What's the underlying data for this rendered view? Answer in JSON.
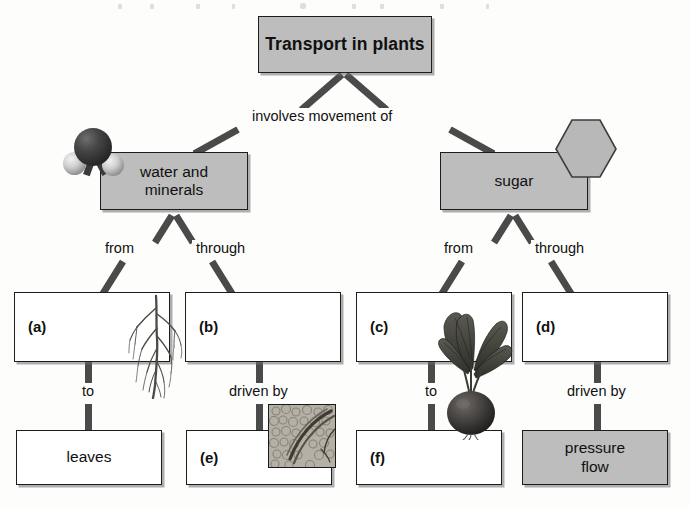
{
  "diagram": {
    "title": "Transport in plants",
    "nodes": {
      "root": "Transport in plants",
      "water": "water and\nminerals",
      "water_line1": "water and",
      "water_line2": "minerals",
      "sugar": "sugar",
      "a": "(a)",
      "b": "(b)",
      "c": "(c)",
      "d": "(d)",
      "e": "(e)",
      "f": "(f)",
      "leaves": "leaves",
      "pressure_flow_line1": "pressure",
      "pressure_flow_line2": "flow"
    },
    "edge_labels": {
      "involves": "involves movement of",
      "water_from": "from",
      "water_through": "through",
      "sugar_from": "from",
      "sugar_through": "through",
      "a_to": "to",
      "b_driven_by": "driven by",
      "c_to": "to",
      "d_driven_by": "driven by"
    },
    "illustrations": {
      "water_molecule": "water-molecule-icon",
      "glucose_hexagon": "glucose-hexagon-icon",
      "root_system": "root-system-illustration",
      "beet_plant": "beet-plant-illustration",
      "tissue_micrograph": "vascular-tissue-micrograph"
    },
    "colors": {
      "fill_gray": "#bdbdbd",
      "fill_white": "#ffffff",
      "border": "#1d1d1d",
      "connector": "#4a4a4a",
      "text": "#101010",
      "page": "#fdfdfc"
    }
  }
}
